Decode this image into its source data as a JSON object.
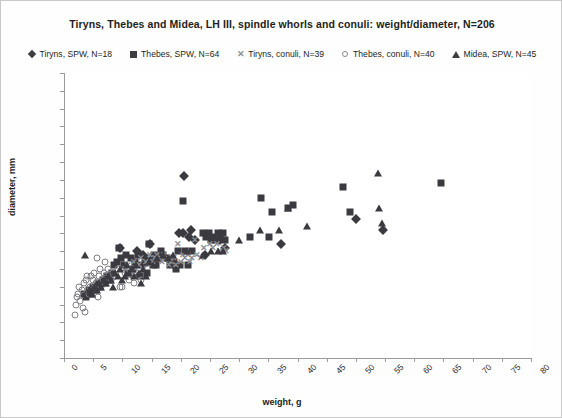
{
  "chart_data": {
    "type": "scatter",
    "title": "Tiryns, Thebes and Midea, LH III, spindle whorls and conuli: weight/diameter, N=206",
    "xlabel": "weight, g",
    "ylabel": "diameter, mm",
    "xlim": [
      0,
      80
    ],
    "ylim": [
      0,
      80
    ],
    "xticks": [
      0,
      5,
      10,
      15,
      20,
      25,
      30,
      35,
      40,
      45,
      50,
      55,
      60,
      65,
      70,
      75,
      80
    ],
    "yticks": [
      0,
      5,
      10,
      15,
      20,
      25,
      30,
      35,
      40,
      45,
      50,
      55,
      60,
      65,
      70,
      75,
      80
    ],
    "grid": false,
    "legend_position": "top",
    "total_n": 206,
    "series": [
      {
        "name": "Tiryns, SPW, N=18",
        "n": 18,
        "marker": "diamond",
        "color": "#3a3a40",
        "points": [
          [
            9.6,
            31
          ],
          [
            12.5,
            30
          ],
          [
            13.5,
            29
          ],
          [
            14.3,
            27
          ],
          [
            14.8,
            32
          ],
          [
            15.2,
            28
          ],
          [
            19.7,
            35
          ],
          [
            20.3,
            35
          ],
          [
            20.6,
            51
          ],
          [
            21.4,
            34
          ],
          [
            21.8,
            36
          ],
          [
            22.4,
            33
          ],
          [
            24.2,
            29
          ],
          [
            26.8,
            33
          ],
          [
            27.6,
            31
          ],
          [
            37.2,
            32
          ],
          [
            50.0,
            39
          ],
          [
            54.6,
            36
          ]
        ]
      },
      {
        "name": "Thebes, SPW, N=64",
        "n": 64,
        "marker": "square",
        "color": "#3a3a40",
        "points": [
          [
            3.4,
            18
          ],
          [
            3.8,
            17
          ],
          [
            4.2,
            19
          ],
          [
            4.6,
            18
          ],
          [
            5.0,
            20
          ],
          [
            5.4,
            19
          ],
          [
            5.8,
            21
          ],
          [
            6.2,
            20
          ],
          [
            6.6,
            22
          ],
          [
            7.0,
            21
          ],
          [
            7.4,
            23
          ],
          [
            7.8,
            22
          ],
          [
            8.2,
            24
          ],
          [
            8.6,
            26
          ],
          [
            9.0,
            27
          ],
          [
            9.4,
            31
          ],
          [
            9.8,
            28
          ],
          [
            10.2,
            26
          ],
          [
            10.6,
            29
          ],
          [
            11.0,
            24
          ],
          [
            11.4,
            28
          ],
          [
            11.8,
            25
          ],
          [
            12.2,
            27
          ],
          [
            12.6,
            29
          ],
          [
            13.0,
            23
          ],
          [
            13.4,
            26
          ],
          [
            13.8,
            28
          ],
          [
            14.2,
            24
          ],
          [
            14.6,
            32
          ],
          [
            15.0,
            27
          ],
          [
            15.4,
            29
          ],
          [
            15.8,
            26
          ],
          [
            16.2,
            28
          ],
          [
            16.6,
            30
          ],
          [
            17.0,
            29
          ],
          [
            17.6,
            28
          ],
          [
            18.2,
            26
          ],
          [
            18.8,
            27
          ],
          [
            19.2,
            25
          ],
          [
            19.6,
            30
          ],
          [
            19.9,
            26
          ],
          [
            20.3,
            44
          ],
          [
            20.8,
            30
          ],
          [
            21.2,
            26
          ],
          [
            23.8,
            35
          ],
          [
            24.4,
            34
          ],
          [
            24.8,
            35
          ],
          [
            25.2,
            33
          ],
          [
            25.6,
            34
          ],
          [
            26.0,
            33
          ],
          [
            26.4,
            35
          ],
          [
            26.8,
            34
          ],
          [
            27.2,
            35
          ],
          [
            27.6,
            33
          ],
          [
            31.8,
            34
          ],
          [
            33.8,
            45
          ],
          [
            35.2,
            34
          ],
          [
            35.6,
            41
          ],
          [
            38.4,
            42
          ],
          [
            39.2,
            43
          ],
          [
            47.8,
            48
          ],
          [
            49.0,
            41
          ],
          [
            64.6,
            49
          ],
          [
            22.0,
            30
          ]
        ]
      },
      {
        "name": "Tiryns, conuli, N=39",
        "n": 39,
        "marker": "x",
        "color": "#8c8c92",
        "points": [
          [
            10.4,
            25
          ],
          [
            11.0,
            26
          ],
          [
            11.6,
            24
          ],
          [
            12.0,
            27
          ],
          [
            12.4,
            25
          ],
          [
            12.8,
            26
          ],
          [
            13.2,
            28
          ],
          [
            13.6,
            25
          ],
          [
            14.0,
            27
          ],
          [
            14.4,
            26
          ],
          [
            14.8,
            29
          ],
          [
            15.2,
            27
          ],
          [
            15.6,
            28
          ],
          [
            16.0,
            29
          ],
          [
            16.4,
            28
          ],
          [
            16.8,
            27
          ],
          [
            17.2,
            29
          ],
          [
            17.6,
            28
          ],
          [
            18.0,
            26
          ],
          [
            18.4,
            27
          ],
          [
            18.8,
            28
          ],
          [
            19.2,
            26
          ],
          [
            19.6,
            32
          ],
          [
            20.0,
            27
          ],
          [
            20.4,
            29
          ],
          [
            20.8,
            28
          ],
          [
            21.2,
            29
          ],
          [
            21.6,
            27
          ],
          [
            22.0,
            28
          ],
          [
            22.4,
            33
          ],
          [
            22.8,
            29
          ],
          [
            23.4,
            28
          ],
          [
            24.0,
            31
          ],
          [
            25.0,
            32
          ],
          [
            25.6,
            31
          ],
          [
            26.2,
            32
          ],
          [
            26.8,
            30
          ],
          [
            27.4,
            31
          ],
          [
            27.8,
            30
          ]
        ]
      },
      {
        "name": "Thebes, conuli, N=40",
        "n": 40,
        "marker": "circle",
        "color": "#7d7d83",
        "points": [
          [
            1.8,
            12
          ],
          [
            2.0,
            15
          ],
          [
            2.2,
            17
          ],
          [
            2.4,
            18
          ],
          [
            2.6,
            20
          ],
          [
            2.8,
            16
          ],
          [
            3.0,
            19
          ],
          [
            3.2,
            14
          ],
          [
            3.4,
            21
          ],
          [
            3.6,
            13
          ],
          [
            3.8,
            22
          ],
          [
            4.0,
            23
          ],
          [
            4.2,
            18
          ],
          [
            4.4,
            20
          ],
          [
            4.6,
            23
          ],
          [
            4.8,
            19
          ],
          [
            5.0,
            22
          ],
          [
            5.2,
            24
          ],
          [
            5.4,
            21
          ],
          [
            5.6,
            28
          ],
          [
            5.8,
            17
          ],
          [
            6.0,
            23
          ],
          [
            6.2,
            25
          ],
          [
            6.4,
            20
          ],
          [
            6.6,
            22
          ],
          [
            6.8,
            24
          ],
          [
            7.0,
            27
          ],
          [
            7.2,
            23
          ],
          [
            7.6,
            25
          ],
          [
            8.0,
            22
          ],
          [
            8.4,
            24
          ],
          [
            8.8,
            23
          ],
          [
            9.2,
            25
          ],
          [
            9.6,
            20
          ],
          [
            10.0,
            20
          ],
          [
            10.4,
            24
          ],
          [
            11.2,
            22
          ],
          [
            12.0,
            21
          ],
          [
            12.6,
            23
          ],
          [
            13.2,
            22
          ]
        ]
      },
      {
        "name": "Midea, SPW, N=45",
        "n": 45,
        "marker": "triangle",
        "color": "#3a3a40",
        "points": [
          [
            3.6,
            29
          ],
          [
            4.4,
            19
          ],
          [
            4.8,
            18
          ],
          [
            5.2,
            20
          ],
          [
            5.6,
            19
          ],
          [
            6.0,
            21
          ],
          [
            6.4,
            20
          ],
          [
            6.8,
            22
          ],
          [
            7.2,
            21
          ],
          [
            7.6,
            23
          ],
          [
            8.0,
            22
          ],
          [
            8.4,
            20
          ],
          [
            8.8,
            24
          ],
          [
            9.2,
            23
          ],
          [
            9.6,
            25
          ],
          [
            10.0,
            22
          ],
          [
            10.4,
            23
          ],
          [
            10.8,
            26
          ],
          [
            11.2,
            24
          ],
          [
            11.6,
            25
          ],
          [
            12.0,
            23
          ],
          [
            12.4,
            26
          ],
          [
            12.8,
            24
          ],
          [
            13.2,
            21
          ],
          [
            13.6,
            25
          ],
          [
            14.0,
            23
          ],
          [
            14.6,
            27
          ],
          [
            15.2,
            26
          ],
          [
            16.0,
            28
          ],
          [
            17.0,
            29
          ],
          [
            17.8,
            28
          ],
          [
            18.6,
            29
          ],
          [
            21.0,
            30
          ],
          [
            23.8,
            29
          ],
          [
            25.2,
            30
          ],
          [
            26.4,
            30
          ],
          [
            27.2,
            30
          ],
          [
            30.0,
            33
          ],
          [
            33.6,
            36
          ],
          [
            36.8,
            36
          ],
          [
            38.4,
            42
          ],
          [
            41.6,
            37
          ],
          [
            53.8,
            52
          ],
          [
            54.0,
            42
          ],
          [
            54.4,
            38
          ]
        ]
      }
    ]
  }
}
